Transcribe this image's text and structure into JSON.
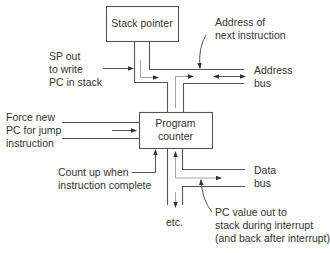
{
  "diagram": {
    "type": "block-diagram",
    "colors": {
      "line": "#555555",
      "text": "#333333",
      "box_border": "#555555",
      "background": "#ffffff"
    },
    "blocks": {
      "stack_pointer": {
        "label": "Stack pointer"
      },
      "program_counter": {
        "label_line1": "Program",
        "label_line2": "counter"
      }
    },
    "annotations": {
      "sp_out": {
        "line1": "SP out",
        "line2": "to write",
        "line3": "PC in stack"
      },
      "address_next": {
        "line1": "Address of",
        "line2": "next instruction"
      },
      "address_bus": {
        "line1": "Address",
        "line2": "bus"
      },
      "force_new_pc": {
        "line1": "Force new",
        "line2": "PC for jump",
        "line3": "instruction"
      },
      "count_up": {
        "line1": "Count up when",
        "line2": "instruction complete"
      },
      "data_bus": {
        "line1": "Data",
        "line2": "bus"
      },
      "pc_value_out": {
        "line1": "PC value out to",
        "line2": "stack during interrupt",
        "line3": "(and back after interrupt)"
      },
      "etc": {
        "text": "etc."
      }
    }
  }
}
